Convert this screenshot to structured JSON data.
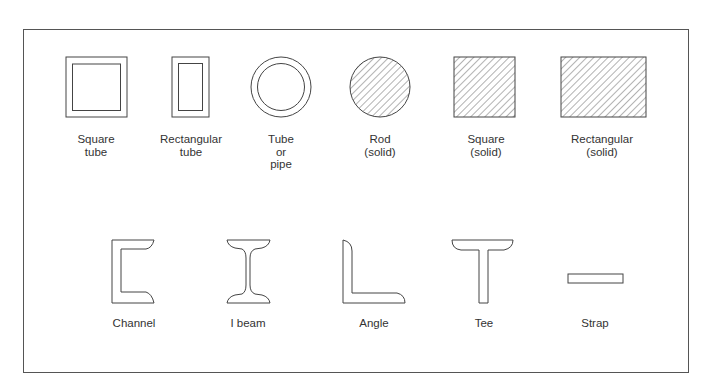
{
  "diagram": {
    "title": "",
    "colors": {
      "stroke": "#444444",
      "frame": "#555555",
      "text": "#333333",
      "background": "#ffffff"
    },
    "rows": [
      {
        "shapes": [
          {
            "id": "square-tube",
            "label_lines": [
              "Square",
              "tube"
            ],
            "cx": 96
          },
          {
            "id": "rectangular-tube",
            "label_lines": [
              "Rectangular",
              "tube"
            ],
            "cx": 191
          },
          {
            "id": "tube-or-pipe",
            "label_lines": [
              "Tube",
              "or",
              "pipe"
            ],
            "cx": 281
          },
          {
            "id": "rod-solid",
            "label_lines": [
              "Rod",
              "(solid)"
            ],
            "cx": 380
          },
          {
            "id": "square-solid",
            "label_lines": [
              "Square",
              "(solid)"
            ],
            "cx": 485
          },
          {
            "id": "rectangular-solid",
            "label_lines": [
              "Rectangular",
              "(solid)"
            ],
            "cx": 601
          }
        ]
      },
      {
        "shapes": [
          {
            "id": "channel",
            "label_lines": [
              "Channel"
            ],
            "cx": 134
          },
          {
            "id": "i-beam",
            "label_lines": [
              "I beam"
            ],
            "cx": 248
          },
          {
            "id": "angle",
            "label_lines": [
              "Angle"
            ],
            "cx": 375
          },
          {
            "id": "tee",
            "label_lines": [
              "Tee"
            ],
            "cx": 484
          },
          {
            "id": "strap",
            "label_lines": [
              "Strap"
            ],
            "cx": 595
          }
        ]
      }
    ]
  }
}
